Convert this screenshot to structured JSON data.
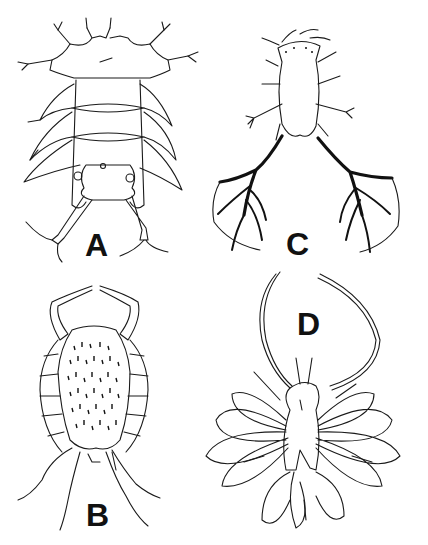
{
  "figure": {
    "panels": [
      {
        "id": "A",
        "label": "A",
        "description": "Segmented larva, dorsal view with setose appendages"
      },
      {
        "id": "B",
        "label": "B",
        "description": "Ovoid spiny body with long antennae and lateral segments"
      },
      {
        "id": "C",
        "label": "C",
        "description": "Elongate body with dark branching posterior appendages"
      },
      {
        "id": "D",
        "label": "D",
        "description": "Body with long looped antennae and petal-shaped lateral lobes"
      }
    ]
  }
}
